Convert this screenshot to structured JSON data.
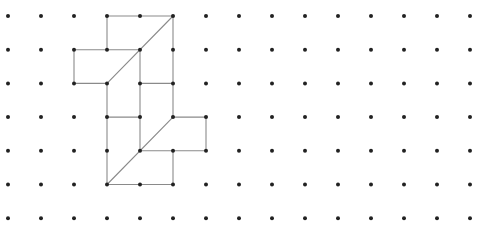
{
  "grid": {
    "cols": 15,
    "rows": 7,
    "x0": 8,
    "dx": 33,
    "y0": 16,
    "dy": 33.7,
    "dot_color": "#222222",
    "dot_radius": 2
  },
  "drawing": {
    "stroke_color": "#8a8a8a",
    "stroke_width": 1.1,
    "segments": [
      [
        3,
        0,
        5,
        0
      ],
      [
        3,
        0,
        3,
        1
      ],
      [
        5,
        0,
        5,
        2
      ],
      [
        2,
        1,
        4,
        1
      ],
      [
        2,
        1,
        2,
        2
      ],
      [
        2,
        2,
        3,
        2
      ],
      [
        5,
        0,
        3,
        2
      ],
      [
        4,
        1,
        4,
        3
      ],
      [
        3,
        2,
        3,
        5
      ],
      [
        4,
        2,
        5,
        2
      ],
      [
        3,
        3,
        4,
        3
      ],
      [
        5,
        2,
        5,
        3
      ],
      [
        5,
        3,
        6,
        3
      ],
      [
        6,
        3,
        6,
        4
      ],
      [
        4,
        4,
        6,
        4
      ],
      [
        4,
        3,
        4,
        4
      ],
      [
        5,
        3,
        3,
        5
      ],
      [
        5,
        4,
        5,
        5
      ],
      [
        3,
        5,
        5,
        5
      ]
    ]
  }
}
